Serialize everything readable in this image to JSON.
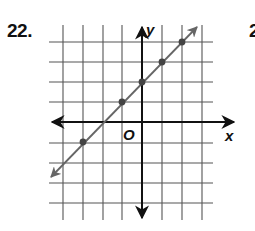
{
  "problem": {
    "number": "22.",
    "next_number_partial": "2"
  },
  "graph": {
    "x_axis_label": "x",
    "y_axis_label": "y",
    "origin_label": "O",
    "grid": {
      "x_range": [
        -4,
        3
      ],
      "y_range": [
        -4,
        4
      ],
      "line_color": "#555555",
      "axis_color": "#111111",
      "plot_line_color": "#666666",
      "point_color": "#444444"
    },
    "line_equation": "y = x + 2",
    "points": [
      {
        "x": -3,
        "y": -1
      },
      {
        "x": -1,
        "y": 1
      },
      {
        "x": 0,
        "y": 2
      },
      {
        "x": 1,
        "y": 3
      },
      {
        "x": 2,
        "y": 4
      }
    ]
  }
}
